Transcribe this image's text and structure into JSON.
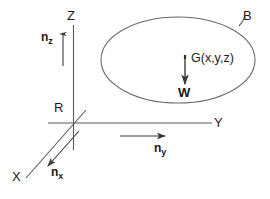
{
  "figure": {
    "background_color": "#ffffff",
    "stroke_color": "#4d4d4d",
    "text_color": "#1a1a1a"
  },
  "axes": [
    {
      "id": "z-axis",
      "label": "Z",
      "label_x": 67,
      "label_y": 9
    },
    {
      "id": "y-axis",
      "label": "Y",
      "label_x": 214,
      "label_y": 116
    },
    {
      "id": "x-axis",
      "label": "X",
      "label_x": 12,
      "label_y": 170
    }
  ],
  "normals": [
    {
      "id": "n-z",
      "base": "n",
      "sub": "z",
      "label_x": 41,
      "label_y": 31
    },
    {
      "id": "n-y",
      "base": "n",
      "sub": "y",
      "label_x": 154,
      "label_y": 142
    },
    {
      "id": "n-x",
      "base": "n",
      "sub": "x",
      "label_x": 51,
      "label_y": 166
    }
  ],
  "points": [
    {
      "id": "origin-point",
      "label": "R",
      "label_x": 54,
      "label_y": 101
    },
    {
      "id": "centroid-point",
      "label": "G(x,y,z)",
      "label_x": 191,
      "label_y": 52
    }
  ],
  "body": {
    "id": "body-outline",
    "label": "B",
    "label_x": 243,
    "label_y": 9,
    "shape": "ellipse"
  },
  "vectors": [
    {
      "id": "weight-vector",
      "label": "W",
      "label_x": 178,
      "label_y": 86
    }
  ]
}
